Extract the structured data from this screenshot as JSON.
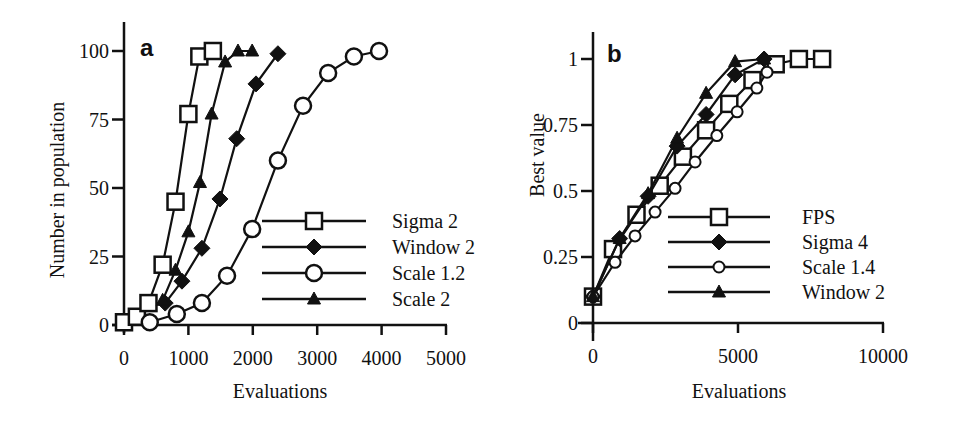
{
  "chart_data": [
    {
      "panel": "a",
      "type": "line",
      "xlabel": "Evaluations",
      "ylabel": "Number in population",
      "xlim": [
        0,
        5000
      ],
      "ylim": [
        0,
        100
      ],
      "xticks": [
        "0",
        "1000",
        "2000",
        "3000",
        "4000",
        "5000"
      ],
      "yticks": [
        "0",
        "25",
        "50",
        "75",
        "100"
      ],
      "grid": false,
      "legend_position": "lower right",
      "series": [
        {
          "name": "Sigma 2",
          "marker": "open-square",
          "x": [
            0,
            200,
            380,
            600,
            800,
            1000,
            1170,
            1380
          ],
          "y": [
            1,
            3,
            8,
            22,
            45,
            77,
            98,
            100
          ]
        },
        {
          "name": "Window 2",
          "marker": "filled-diamond",
          "x": [
            640,
            900,
            1210,
            1490,
            1750,
            2050,
            2390
          ],
          "y": [
            8,
            16,
            28,
            46,
            68,
            88,
            99
          ]
        },
        {
          "name": "Scale 1.2",
          "marker": "open-circle",
          "x": [
            400,
            820,
            1210,
            1600,
            1990,
            2390,
            2780,
            3170,
            3570,
            3960
          ],
          "y": [
            1,
            4,
            8,
            18,
            35,
            60,
            80,
            92,
            98,
            100
          ]
        },
        {
          "name": "Scale 2",
          "marker": "filled-triangle",
          "x": [
            600,
            800,
            1000,
            1180,
            1360,
            1570,
            1770,
            1990
          ],
          "y": [
            9,
            20,
            34,
            52,
            77,
            96,
            100,
            100
          ]
        }
      ]
    },
    {
      "panel": "b",
      "type": "line",
      "xlabel": "Evaluations",
      "ylabel": "Best value",
      "xlim": [
        0,
        10000
      ],
      "ylim": [
        0,
        1
      ],
      "xticks": [
        "0",
        "5000",
        "10000"
      ],
      "yticks": [
        "0",
        "0.25",
        "0.5",
        "0.75",
        "1"
      ],
      "grid": false,
      "legend_position": "lower right",
      "series": [
        {
          "name": "FPS",
          "marker": "open-square",
          "x": [
            0,
            690,
            1500,
            2300,
            3100,
            3900,
            4700,
            5500,
            6300,
            7100,
            7900
          ],
          "y": [
            0.1,
            0.28,
            0.41,
            0.52,
            0.63,
            0.73,
            0.83,
            0.92,
            0.98,
            1.0,
            1.0
          ]
        },
        {
          "name": "Sigma 4",
          "marker": "filled-diamond",
          "x": [
            0,
            920,
            1900,
            2900,
            3900,
            4900,
            5900
          ],
          "y": [
            0.1,
            0.32,
            0.48,
            0.67,
            0.79,
            0.94,
            1.0
          ]
        },
        {
          "name": "Scale 1.4",
          "marker": "open-circle-small",
          "x": [
            0,
            760,
            1450,
            2140,
            2830,
            3520,
            4270,
            4970,
            5650,
            6000
          ],
          "y": [
            0.1,
            0.23,
            0.33,
            0.42,
            0.51,
            0.61,
            0.71,
            0.8,
            0.89,
            0.95
          ]
        },
        {
          "name": "Window 2",
          "marker": "filled-triangle",
          "x": [
            0,
            920,
            1900,
            2900,
            3900,
            4900,
            5900
          ],
          "y": [
            0.1,
            0.32,
            0.49,
            0.7,
            0.87,
            0.99,
            1.0
          ]
        }
      ]
    }
  ],
  "panels": {
    "a": {
      "label": "a",
      "xlabel": "Evaluations",
      "ylabel": "Number in population"
    },
    "b": {
      "label": "b",
      "xlabel": "Evaluations",
      "ylabel": "Best value"
    }
  },
  "colors": {
    "ink": "#111111",
    "background": "#ffffff"
  }
}
